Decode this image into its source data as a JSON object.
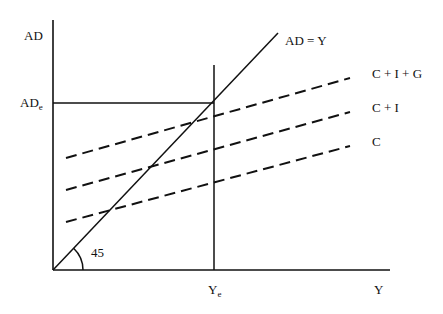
{
  "diagram": {
    "type": "keynesian-cross",
    "axes": {
      "y_label": "AD",
      "x_label": "Y"
    },
    "equilibrium": {
      "ad_label_main": "AD",
      "ad_label_sub": "e",
      "y_label_main": "Y",
      "y_label_sub": "e"
    },
    "angle_label": "45",
    "lines": [
      {
        "id": "ad-equals-y",
        "label": "AD = Y",
        "style": "solid"
      },
      {
        "id": "c-i-g",
        "label": "C + I + G",
        "style": "dashed"
      },
      {
        "id": "c-i",
        "label": "C + I",
        "style": "dashed"
      },
      {
        "id": "c",
        "label": "C",
        "style": "dashed"
      }
    ]
  }
}
